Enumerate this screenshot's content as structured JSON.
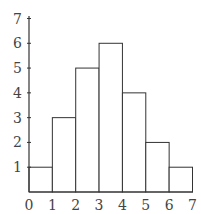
{
  "chart_data": {
    "type": "bar",
    "subtype": "histogram",
    "title": "",
    "xlabel": "",
    "ylabel": "",
    "bins": [
      [
        0,
        1
      ],
      [
        1,
        2
      ],
      [
        2,
        3
      ],
      [
        3,
        4
      ],
      [
        4,
        5
      ],
      [
        5,
        6
      ],
      [
        6,
        7
      ]
    ],
    "categories": [
      "0-1",
      "1-2",
      "2-3",
      "3-4",
      "4-5",
      "5-6",
      "6-7"
    ],
    "values": [
      1,
      3,
      5,
      6,
      4,
      2,
      1
    ],
    "xlim": [
      0,
      7
    ],
    "ylim": [
      0,
      7
    ],
    "x_ticks": [
      "0",
      "1",
      "2",
      "3",
      "4",
      "5",
      "6",
      "7"
    ],
    "y_ticks": [
      "1",
      "2",
      "3",
      "4",
      "5",
      "6",
      "7"
    ],
    "grid": false,
    "legend": null,
    "colors": {
      "bar_fill": "#ffffff",
      "bar_stroke": "#333333",
      "axis": "#333333"
    }
  }
}
